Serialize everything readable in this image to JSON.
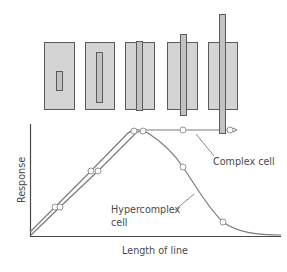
{
  "figure": {
    "stimuli": [
      {
        "id": 1,
        "field": {
          "x": 44,
          "y": 42,
          "w": 30,
          "h": 67
        },
        "bar": {
          "x": 56,
          "y": 71,
          "w": 6,
          "h": 19
        }
      },
      {
        "id": 2,
        "field": {
          "x": 85,
          "y": 42,
          "w": 29,
          "h": 67
        },
        "bar": {
          "x": 96,
          "y": 52,
          "w": 6,
          "h": 50
        }
      },
      {
        "id": 3,
        "field": {
          "x": 125,
          "y": 42,
          "w": 29,
          "h": 67
        },
        "bar": {
          "x": 136,
          "y": 41,
          "w": 6,
          "h": 69
        }
      },
      {
        "id": 4,
        "field": {
          "x": 167,
          "y": 42,
          "w": 30,
          "h": 67
        },
        "bar": {
          "x": 180,
          "y": 34,
          "w": 6,
          "h": 81
        }
      },
      {
        "id": 5,
        "field": {
          "x": 208,
          "y": 42,
          "w": 29,
          "h": 67
        },
        "bar": {
          "x": 219,
          "y": 14,
          "w": 6,
          "h": 119
        }
      }
    ],
    "colors": {
      "field_fill": "#d4d4d4",
      "bar_fill": "#c2c2c2",
      "stroke": "#5a5a5a",
      "curve": "#7a7a7a",
      "axis": "#4a4a4a",
      "text": "#4a4a4a"
    },
    "labels": {
      "ylabel": "Response",
      "xlabel": "Length of line",
      "complex_cell": "Complex cell",
      "hypercomplex_line1": "Hypercomplex",
      "hypercomplex_line2": "cell"
    }
  },
  "chart_data": {
    "type": "line",
    "title": "",
    "xlabel": "Length of line",
    "ylabel": "Response",
    "grid": false,
    "legend": "inline annotations",
    "x": [
      1,
      2,
      3,
      4,
      5
    ],
    "x_description": "Stimulus bar length (stimuli 1-5, increasing)",
    "series": [
      {
        "name": "Complex cell",
        "values": [
          0.27,
          0.62,
          0.98,
          1.0,
          1.0
        ],
        "behavior": "rises then plateaus"
      },
      {
        "name": "Hypercomplex cell",
        "values": [
          0.27,
          0.62,
          0.98,
          0.66,
          0.13
        ],
        "behavior": "rises, peaks, then falls (end-stopping)"
      }
    ],
    "ylim": [
      0,
      1
    ],
    "axis_ticks": "none"
  }
}
